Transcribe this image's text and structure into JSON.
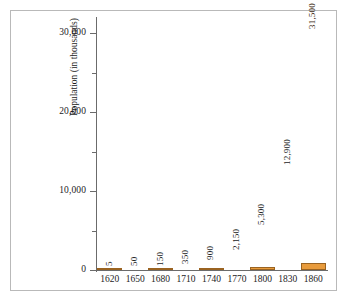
{
  "chart_data": {
    "type": "bar",
    "title": "",
    "xlabel": "",
    "ylabel": "Population (in thousands)",
    "categories": [
      "1620",
      "1650",
      "1680",
      "1710",
      "1740",
      "1770",
      "1800",
      "1830",
      "1860"
    ],
    "values": [
      5,
      50,
      150,
      350,
      900,
      2150,
      5300,
      12900,
      31500
    ],
    "value_labels": [
      "5",
      "50",
      "150",
      "350",
      "900",
      "2,150",
      "5,300",
      "12,900",
      "31,500"
    ],
    "ylim": [
      0,
      31800
    ],
    "ytick_values": [
      0,
      10000,
      20000,
      30000
    ],
    "ytick_labels": [
      "0",
      "10,000",
      "20,000",
      "30,000"
    ],
    "yminor_values": [
      5000,
      15000,
      25000
    ],
    "grid": false,
    "legend": "none",
    "bar_color": "#e89b3c",
    "bar_border_color": "#9a6321",
    "axis_color": "#6b6b6b",
    "background": "#ffffff"
  }
}
